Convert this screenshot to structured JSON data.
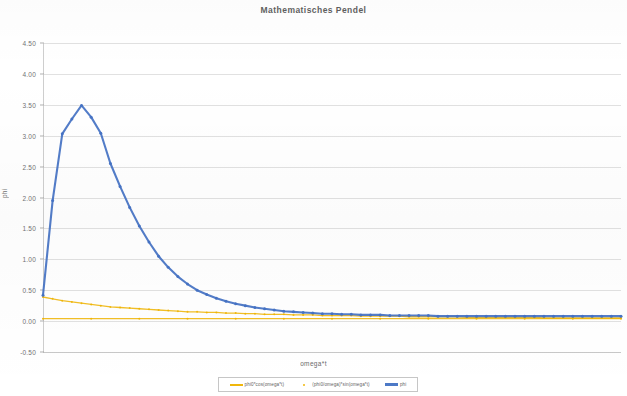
{
  "chart_data": {
    "type": "line",
    "title": "Mathematisches Pendel",
    "xlabel": "omega*t",
    "ylabel": "phi",
    "grid": true,
    "legend_position": "bottom",
    "ylim": [
      -0.5,
      4.5
    ],
    "ytick_labels": [
      "4.50",
      "4.00",
      "3.50",
      "3.00",
      "2.50",
      "2.00",
      "1.50",
      "1.00",
      "0.50",
      "0.00",
      "-0.50"
    ],
    "ytick_values": [
      4.5,
      4.0,
      3.5,
      3.0,
      2.5,
      2.0,
      1.5,
      1.0,
      0.5,
      0.0,
      -0.5
    ],
    "xlim": [
      0,
      60
    ],
    "xtick_labels": [],
    "series": [
      {
        "name": "phi0*cos(omega*t)",
        "color": "#f0b400",
        "marker": "dot",
        "x": [
          0,
          1,
          2,
          3,
          4,
          5,
          6,
          7,
          8,
          9,
          10,
          11,
          12,
          13,
          14,
          15,
          16,
          17,
          18,
          19,
          20,
          21,
          22,
          23,
          24,
          25,
          26,
          27,
          28,
          29,
          30,
          31,
          32,
          33,
          34,
          35,
          36,
          37,
          38,
          39,
          40,
          41,
          42,
          43,
          44,
          45,
          46,
          47,
          48,
          49,
          50,
          51,
          52,
          53,
          54,
          55,
          56,
          57,
          58,
          59,
          60
        ],
        "values": [
          0.39,
          0.36,
          0.33,
          0.31,
          0.29,
          0.27,
          0.25,
          0.23,
          0.22,
          0.21,
          0.2,
          0.19,
          0.18,
          0.17,
          0.16,
          0.15,
          0.15,
          0.14,
          0.14,
          0.13,
          0.13,
          0.12,
          0.12,
          0.11,
          0.11,
          0.11,
          0.1,
          0.1,
          0.1,
          0.09,
          0.09,
          0.09,
          0.09,
          0.08,
          0.08,
          0.08,
          0.08,
          0.08,
          0.07,
          0.07,
          0.07,
          0.07,
          0.07,
          0.07,
          0.06,
          0.06,
          0.06,
          0.06,
          0.06,
          0.06,
          0.06,
          0.06,
          0.05,
          0.05,
          0.05,
          0.05,
          0.05,
          0.05,
          0.05,
          0.05,
          0.05
        ]
      },
      {
        "name": "(phi0/omega)*sin(omega*t)",
        "color": "#f0b400",
        "marker": "dot",
        "x": [
          0,
          5,
          10,
          15,
          20,
          25,
          30,
          35,
          40,
          45,
          50,
          55,
          60
        ],
        "values": [
          0.04,
          0.04,
          0.04,
          0.04,
          0.04,
          0.04,
          0.04,
          0.04,
          0.04,
          0.04,
          0.04,
          0.04,
          0.04
        ]
      },
      {
        "name": "phi",
        "color": "#4472c4",
        "marker": "dot",
        "x": [
          0,
          1,
          2,
          3,
          4,
          5,
          6,
          7,
          8,
          9,
          10,
          11,
          12,
          13,
          14,
          15,
          16,
          17,
          18,
          19,
          20,
          21,
          22,
          23,
          24,
          25,
          26,
          27,
          28,
          29,
          30,
          31,
          32,
          33,
          34,
          35,
          36,
          37,
          38,
          39,
          40,
          41,
          42,
          43,
          44,
          45,
          46,
          47,
          48,
          49,
          50,
          51,
          52,
          53,
          54,
          55,
          56,
          57,
          58,
          59,
          60
        ],
        "values": [
          0.42,
          1.95,
          3.03,
          3.27,
          3.49,
          3.3,
          3.04,
          2.55,
          2.18,
          1.84,
          1.54,
          1.28,
          1.05,
          0.87,
          0.72,
          0.6,
          0.5,
          0.43,
          0.37,
          0.32,
          0.28,
          0.25,
          0.22,
          0.2,
          0.18,
          0.16,
          0.15,
          0.14,
          0.13,
          0.12,
          0.12,
          0.11,
          0.11,
          0.1,
          0.1,
          0.1,
          0.09,
          0.09,
          0.09,
          0.09,
          0.09,
          0.08,
          0.08,
          0.08,
          0.08,
          0.08,
          0.08,
          0.08,
          0.08,
          0.08,
          0.08,
          0.08,
          0.08,
          0.08,
          0.08,
          0.08,
          0.08,
          0.08,
          0.08,
          0.08,
          0.08
        ]
      }
    ]
  },
  "legend": {
    "items": [
      {
        "label": "phi0*cos(omega*t)",
        "color": "#f0b400",
        "style": "line"
      },
      {
        "label": "(phi0/omega)*sin(omega*t)",
        "color": "#f0b400",
        "style": "dot"
      },
      {
        "label": "phi",
        "color": "#4472c4",
        "style": "line"
      }
    ]
  }
}
